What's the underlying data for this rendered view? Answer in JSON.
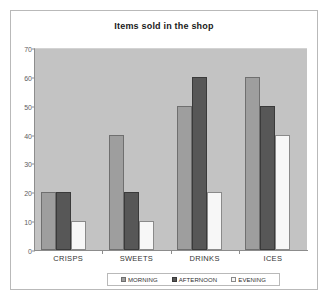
{
  "chart_data": {
    "type": "bar",
    "title": "Items sold in the shop",
    "xlabel": "",
    "ylabel": "",
    "categories": [
      "CRISPS",
      "SWEETS",
      "DRINKS",
      "ICES"
    ],
    "series": [
      {
        "name": "MORNING",
        "color": "#9e9e9e",
        "values": [
          20,
          40,
          50,
          60
        ]
      },
      {
        "name": "AFTERNOON",
        "color": "#575757",
        "values": [
          20,
          20,
          60,
          50
        ]
      },
      {
        "name": "EVENING",
        "color": "#f7f7f7",
        "values": [
          10,
          10,
          20,
          40
        ]
      }
    ],
    "ylim": [
      0,
      70
    ],
    "yticks": [
      0,
      10,
      20,
      30,
      40,
      50,
      60,
      70
    ],
    "ytick_labels": [
      "0",
      "10",
      "20",
      "30",
      "40",
      "50",
      "60",
      "70"
    ],
    "grid": false,
    "legend_position": "bottom",
    "plot_background": "#c3c3c3",
    "figure_background": "#ffffff"
  }
}
